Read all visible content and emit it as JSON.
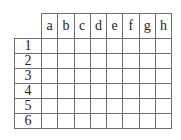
{
  "grid": {
    "columns": [
      "a",
      "b",
      "c",
      "d",
      "e",
      "f",
      "g",
      "h"
    ],
    "rows": [
      "1",
      "2",
      "3",
      "4",
      "5",
      "6"
    ],
    "cells": [
      [
        "",
        "",
        "",
        "",
        "",
        "",
        "",
        ""
      ],
      [
        "",
        "",
        "",
        "",
        "",
        "",
        "",
        ""
      ],
      [
        "",
        "",
        "",
        "",
        "",
        "",
        "",
        ""
      ],
      [
        "",
        "",
        "",
        "",
        "",
        "",
        "",
        ""
      ],
      [
        "",
        "",
        "",
        "",
        "",
        "",
        "",
        ""
      ],
      [
        "",
        "",
        "",
        "",
        "",
        "",
        "",
        ""
      ]
    ]
  },
  "colors": {
    "grid_line": "#6f6f6f",
    "text": "#222222",
    "background": "#ffffff"
  }
}
